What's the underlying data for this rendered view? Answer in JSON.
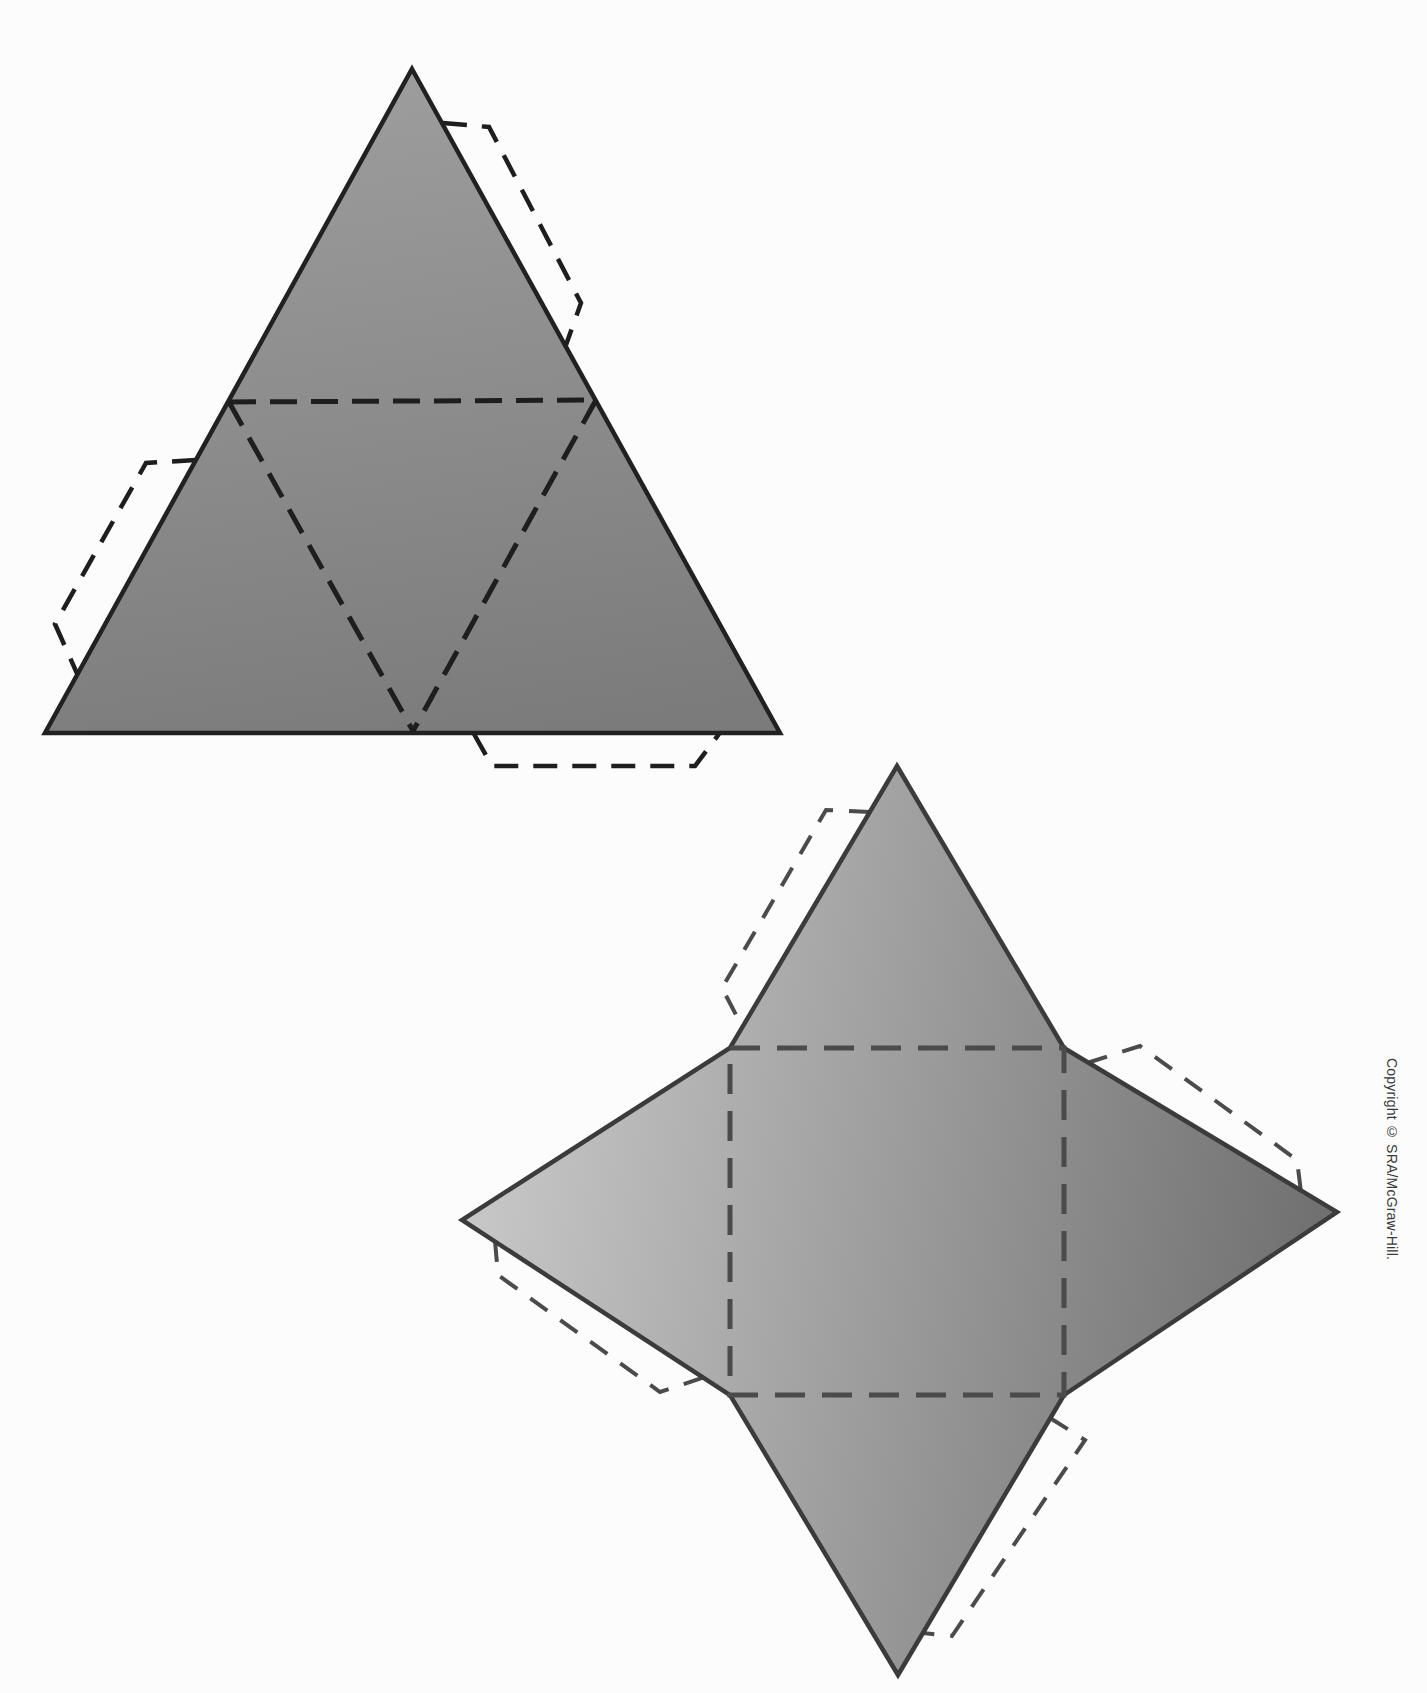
{
  "page": {
    "background": "#fcfcfc"
  },
  "copyright": {
    "text": "Copyright © SRA/McGraw-Hill."
  },
  "nets": [
    {
      "name": "triangular-pyramid-net",
      "label": "tetrahedron net (large triangle with inner dashed fold triangle and three glue tabs)",
      "outline": "412,69 780,733 45,733",
      "gradient": {
        "x1": 380,
        "y1": 70,
        "x2": 470,
        "y2": 745,
        "from": "#9d9d9d",
        "to": "#7b7b7b"
      },
      "outline_stroke": "#212121",
      "outline_width": 4.5,
      "fold": {
        "color": "#1e1e1e",
        "width": 5,
        "dash": "27 14",
        "lines": [
          "229,402 596,400",
          "596,400 413,731",
          "229,402 413,731"
        ]
      },
      "tabs": {
        "color": "#1e1e1e",
        "width": 4.5,
        "dash": "24 15",
        "lines": [
          "443,123 489,127 581,303 566,345",
          "196,460 146,463 55,624 79,678",
          "474,734 492,766 695,766 719,734"
        ]
      }
    },
    {
      "name": "square-pyramid-net",
      "label": "square pyramid net (four-pointed star with central dashed square base and four glue tabs)",
      "outline": "897,766 1064,1048 1337,1212 1064,1395 898,1675 730,1395 462,1220 730,1048",
      "gradient": {
        "x1": 462,
        "y1": 1150,
        "x2": 1337,
        "y2": 1280,
        "from": "#c9c9c9",
        "to": "#6e6e6e"
      },
      "outline_stroke": "#3b3b3b",
      "outline_width": 4.5,
      "fold": {
        "color": "#4b4b4b",
        "width": 5,
        "dash": "30 17",
        "lines": [
          "730,1048 1064,1048 1064,1395 730,1395 730,1048"
        ]
      },
      "tabs": {
        "color": "#4b4b4b",
        "width": 4,
        "dash": "21 16",
        "lines": [
          "870,812 826,810 722,988 745,1032",
          "1087,1063 1140,1046 1297,1160 1301,1192",
          "495,1241 498,1275 660,1392 705,1377",
          "1050,1418 1085,1440 952,1636 923,1633"
        ]
      }
    }
  ]
}
